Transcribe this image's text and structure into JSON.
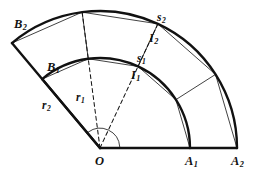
{
  "figure": {
    "kind": "geometry-diagram",
    "background_color": "#ffffff",
    "stroke_color": "#111111",
    "labels": {
      "center": {
        "base": "O",
        "sub": ""
      },
      "inner_radius": {
        "base": "r",
        "sub": "1"
      },
      "outer_radius": {
        "base": "r",
        "sub": "2"
      },
      "inner_arc": {
        "base": "s",
        "sub": "1"
      },
      "outer_arc": {
        "base": "s",
        "sub": "2"
      },
      "inner_mid": {
        "base": "I",
        "sub": "1"
      },
      "outer_mid": {
        "base": "I",
        "sub": "2"
      },
      "inner_start": {
        "base": "A",
        "sub": "1"
      },
      "outer_start": {
        "base": "A",
        "sub": "2"
      },
      "inner_end": {
        "base": "B",
        "sub": "1"
      },
      "outer_end": {
        "base": "B",
        "sub": "2"
      }
    },
    "label_positions": {
      "center": {
        "x": 95,
        "y": 155
      },
      "inner_radius": {
        "x": 76,
        "y": 92
      },
      "outer_radius": {
        "x": 42,
        "y": 100
      },
      "inner_arc": {
        "x": 137,
        "y": 53
      },
      "outer_arc": {
        "x": 157,
        "y": 12
      },
      "inner_mid": {
        "x": 131,
        "y": 69
      },
      "outer_mid": {
        "x": 149,
        "y": 32
      },
      "inner_start": {
        "x": 185,
        "y": 155
      },
      "outer_start": {
        "x": 231,
        "y": 155
      },
      "inner_end": {
        "x": 47,
        "y": 61
      },
      "outer_end": {
        "x": 14,
        "y": 18
      }
    },
    "geometry": {
      "center_point": {
        "x": 100,
        "y": 148
      },
      "inner_radius_px": 90,
      "outer_radius_px": 137,
      "start_angle_deg": 0,
      "end_angle_deg": 130,
      "mid_angle_deg": 65,
      "quarter_angle_deg": 32.5,
      "stroke_thick": 2.4,
      "stroke_thin": 0.8,
      "dash_pattern": "4,3"
    }
  }
}
